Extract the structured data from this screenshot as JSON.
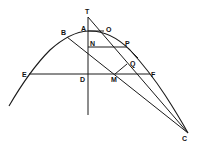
{
  "diagram": {
    "type": "geometric-construction",
    "points": {
      "T": {
        "label": "T",
        "x": 88,
        "y": 17
      },
      "A": {
        "label": "A",
        "x": 88,
        "y": 31
      },
      "O": {
        "label": "O",
        "x": 104,
        "y": 31
      },
      "B": {
        "label": "B",
        "x": 67,
        "y": 37
      },
      "N": {
        "label": "N",
        "x": 88,
        "y": 47
      },
      "P": {
        "label": "P",
        "x": 127,
        "y": 47
      },
      "Q": {
        "label": "Q",
        "x": 128,
        "y": 65
      },
      "E": {
        "label": "E",
        "x": 29,
        "y": 74
      },
      "D": {
        "label": "D",
        "x": 88,
        "y": 74
      },
      "M": {
        "label": "M",
        "x": 115,
        "y": 74
      },
      "F": {
        "label": "F",
        "x": 150,
        "y": 74
      },
      "C": {
        "label": "C",
        "x": 188,
        "y": 133
      }
    },
    "labels": [
      "T",
      "A",
      "O",
      "B",
      "N",
      "P",
      "Q",
      "E",
      "D",
      "M",
      "F",
      "C"
    ],
    "segments": [
      {
        "name": "axis-TD",
        "from": "T",
        "to": "axis-bottom"
      },
      {
        "name": "tangent-TC",
        "from": "T",
        "to": "C"
      },
      {
        "name": "chord-BC",
        "from": "B",
        "to": "C"
      },
      {
        "name": "ordinate-NP",
        "from": "N",
        "to": "P"
      },
      {
        "name": "chord-EF",
        "from": "E",
        "to": "F"
      },
      {
        "name": "segment-MQ",
        "from": "M",
        "to": "Q"
      },
      {
        "name": "chord-AO",
        "from": "A",
        "to": "O"
      }
    ],
    "colors": {
      "stroke": "#1a1a1a",
      "background": "#ffffff"
    }
  }
}
